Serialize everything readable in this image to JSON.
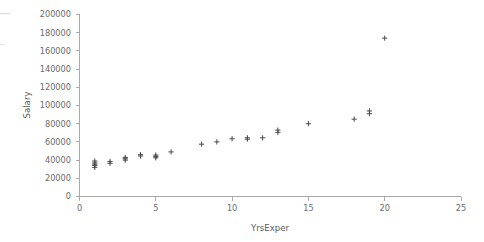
{
  "chart_data": {
    "type": "scatter",
    "title": "",
    "subtitle": "",
    "xlabel": "YrsExper",
    "ylabel": "Salary",
    "xlim": [
      0,
      25
    ],
    "ylim": [
      0,
      200000
    ],
    "xticks": [
      0,
      5,
      10,
      15,
      20,
      25
    ],
    "xtick_labels": [
      "0",
      "5",
      "10",
      "15",
      "20",
      "25"
    ],
    "yticks": [
      0,
      20000,
      40000,
      60000,
      80000,
      100000,
      120000,
      140000,
      160000,
      180000,
      200000
    ],
    "ytick_labels": [
      "0",
      "20000",
      "40000",
      "60000",
      "80000",
      "100000",
      "120000",
      "140000",
      "160000",
      "180000",
      "200000"
    ],
    "grid": false,
    "legend": null,
    "marker": "plus",
    "marker_color": "#4a4a4a",
    "points": [
      {
        "x": 1,
        "y": 32000
      },
      {
        "x": 1,
        "y": 34000
      },
      {
        "x": 1,
        "y": 35500
      },
      {
        "x": 1,
        "y": 37000
      },
      {
        "x": 1,
        "y": 39000
      },
      {
        "x": 2,
        "y": 36500
      },
      {
        "x": 2,
        "y": 38500
      },
      {
        "x": 3,
        "y": 40000
      },
      {
        "x": 3,
        "y": 41500
      },
      {
        "x": 3,
        "y": 43000
      },
      {
        "x": 4,
        "y": 44500
      },
      {
        "x": 4,
        "y": 46000
      },
      {
        "x": 5,
        "y": 42500
      },
      {
        "x": 5,
        "y": 44000
      },
      {
        "x": 5,
        "y": 45500
      },
      {
        "x": 6,
        "y": 49000
      },
      {
        "x": 8,
        "y": 57500
      },
      {
        "x": 9,
        "y": 60000
      },
      {
        "x": 10,
        "y": 63500
      },
      {
        "x": 11,
        "y": 63000
      },
      {
        "x": 11,
        "y": 64500
      },
      {
        "x": 12,
        "y": 64500
      },
      {
        "x": 13,
        "y": 70500
      },
      {
        "x": 13,
        "y": 73000
      },
      {
        "x": 15,
        "y": 80000
      },
      {
        "x": 18,
        "y": 85000
      },
      {
        "x": 19,
        "y": 91000
      },
      {
        "x": 19,
        "y": 94000
      },
      {
        "x": 20,
        "y": 174000
      }
    ]
  },
  "axes": {
    "y_axis_name": "salary-axis",
    "x_axis_name": "yrsexper-axis"
  }
}
